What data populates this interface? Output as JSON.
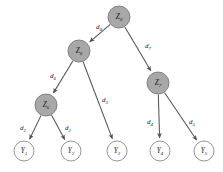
{
  "diagram": {
    "type": "tree",
    "colors": {
      "internal_node_fill": "#a8a8a8",
      "internal_node_stroke": "#7a7a7a",
      "leaf_node_fill": "#ffffff",
      "leaf_node_stroke": "#8a8a8a",
      "edge_stroke": "#555555",
      "label_color": "#1a1a1a",
      "background": "#ffffff"
    },
    "nodes": [
      {
        "id": "Z9",
        "base": "Z",
        "sub": "9",
        "kind": "internal",
        "cx": 119,
        "cy": 17,
        "r": 11
      },
      {
        "id": "Z8",
        "base": "Z",
        "sub": "8",
        "kind": "internal",
        "cx": 79,
        "cy": 51,
        "r": 11
      },
      {
        "id": "Z7",
        "base": "Z",
        "sub": "7",
        "kind": "internal",
        "cx": 158,
        "cy": 83,
        "r": 11
      },
      {
        "id": "Z6",
        "base": "Z",
        "sub": "6",
        "kind": "internal",
        "cx": 46,
        "cy": 105,
        "r": 11
      },
      {
        "id": "Y1",
        "base": "Y",
        "sub": "1",
        "kind": "leaf",
        "cx": 24,
        "cy": 151,
        "r": 10
      },
      {
        "id": "Y2",
        "base": "Y",
        "sub": "2",
        "kind": "leaf",
        "cx": 71,
        "cy": 151,
        "r": 10
      },
      {
        "id": "Y3",
        "base": "Y",
        "sub": "3",
        "kind": "leaf",
        "cx": 117,
        "cy": 151,
        "r": 10
      },
      {
        "id": "Y4",
        "base": "Y",
        "sub": "4",
        "kind": "leaf",
        "cx": 160,
        "cy": 151,
        "r": 10
      },
      {
        "id": "Y5",
        "base": "Y",
        "sub": "5",
        "kind": "leaf",
        "cx": 204,
        "cy": 151,
        "r": 10
      }
    ],
    "edges": [
      {
        "id": "d8",
        "base": "d",
        "sub": "8",
        "from": "Z9",
        "to": "Z8",
        "label_x": 99,
        "label_y": 27
      },
      {
        "id": "d7",
        "base": "d",
        "sub": "7",
        "from": "Z9",
        "to": "Z7",
        "label_x": 148,
        "label_y": 46
      },
      {
        "id": "d6",
        "base": "d",
        "sub": "6",
        "from": "Z8",
        "to": "Z6",
        "label_x": 53,
        "label_y": 76
      },
      {
        "id": "d3",
        "base": "d",
        "sub": "3",
        "from": "Z8",
        "to": "Y3",
        "label_x": 105,
        "label_y": 100
      },
      {
        "id": "d1",
        "base": "d",
        "sub": "1",
        "from": "Z6",
        "to": "Y1",
        "label_x": 23,
        "label_y": 128
      },
      {
        "id": "d2",
        "base": "d",
        "sub": "2",
        "from": "Z6",
        "to": "Y2",
        "label_x": 68,
        "label_y": 128
      },
      {
        "id": "d4",
        "base": "d",
        "sub": "4",
        "from": "Z7",
        "to": "Y4",
        "label_x": 150,
        "label_y": 122
      },
      {
        "id": "d5",
        "base": "d",
        "sub": "5",
        "from": "Z7",
        "to": "Y5",
        "label_x": 192,
        "label_y": 122
      }
    ]
  }
}
